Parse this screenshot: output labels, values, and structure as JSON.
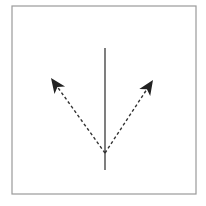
{
  "diagram": {
    "type": "ray-diagram",
    "colors": {
      "background": "#ffffff",
      "frame": "#9a9a9a",
      "line": "#3a3a3a",
      "arrow": "#222222"
    },
    "frame": {
      "x": 12,
      "y": 6,
      "width": 184,
      "height": 188
    },
    "vertical_line": {
      "x": 105,
      "y1": 48,
      "y2": 170
    },
    "origin_point": {
      "x": 105,
      "y": 153
    },
    "arrows": [
      {
        "id": "left",
        "from": [
          105,
          153
        ],
        "to": [
          51,
          78
        ],
        "style": "dashed"
      },
      {
        "id": "right",
        "from": [
          105,
          153
        ],
        "to": [
          153,
          80
        ],
        "style": "dashed"
      }
    ],
    "labels": []
  }
}
